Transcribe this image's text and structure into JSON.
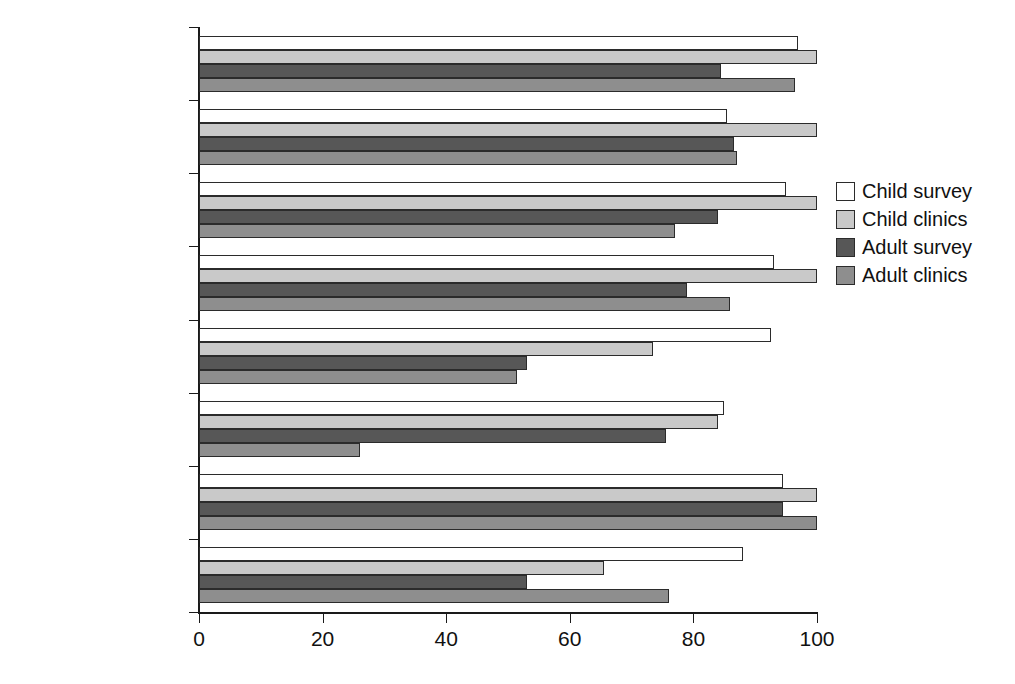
{
  "chart_data": {
    "type": "bar",
    "orientation": "horizontal",
    "title": "",
    "xlabel": "",
    "ylabel": "",
    "xlim": [
      0,
      100
    ],
    "xticks": [
      0,
      20,
      40,
      60,
      80,
      100
    ],
    "xtick_labels": [
      "0",
      "20",
      "40",
      "60",
      "80",
      "100"
    ],
    "grid": false,
    "legend_position": "right",
    "categories": [
      "Northern Ireland",
      "North Western",
      "Mersey",
      "West Midlands",
      "South Western",
      "Wessex",
      "Yorkshire",
      "Northern"
    ],
    "series": [
      {
        "name": "Child survey",
        "color": "#ffffff",
        "values": [
          97,
          85.5,
          95,
          93,
          92.5,
          85,
          94.5,
          88
        ]
      },
      {
        "name": "Child clinics",
        "color": "#c9c9c9",
        "values": [
          100,
          100,
          100,
          100,
          73.5,
          84,
          100,
          65.5
        ]
      },
      {
        "name": "Adult survey",
        "color": "#575757",
        "values": [
          84.5,
          86.5,
          84,
          79,
          53,
          75.5,
          94.5,
          53
        ]
      },
      {
        "name": "Adult clinics",
        "color": "#8e8e8e",
        "values": [
          96.5,
          87,
          77,
          86,
          51.5,
          26,
          100,
          76
        ]
      }
    ]
  },
  "legend": {
    "items": [
      {
        "label": "Child survey"
      },
      {
        "label": "Child clinics"
      },
      {
        "label": "Adult survey"
      },
      {
        "label": "Adult clinics"
      }
    ]
  },
  "axis": {
    "x_tick_labels": [
      "0",
      "20",
      "40",
      "60",
      "80",
      "100"
    ]
  }
}
